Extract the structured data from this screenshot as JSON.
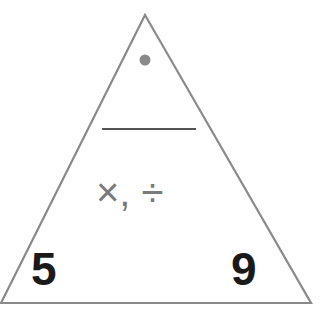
{
  "diagram": {
    "type": "fact-family-triangle",
    "top_value": "•",
    "top_value_blank": true,
    "operations": "×, ÷",
    "bottom_left": "5",
    "bottom_right": "9",
    "colors": {
      "outline": "#8a8a8a",
      "dot": "#8a8a8a",
      "line": "#555555",
      "operations": "#7a7a7a",
      "numbers": "#1a1a1a"
    }
  }
}
